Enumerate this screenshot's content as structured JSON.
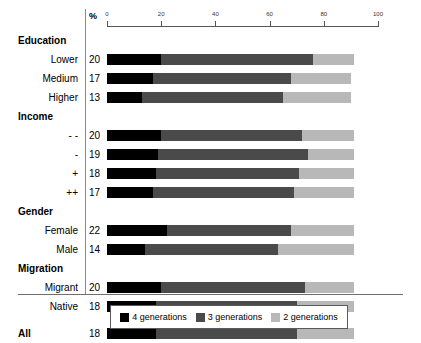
{
  "chart_data": {
    "type": "bar",
    "orientation": "horizontal",
    "stacked": true,
    "title": "",
    "xlabel": "%",
    "ylabel": "",
    "xlim": [
      0,
      100
    ],
    "xticks": [
      0,
      20,
      40,
      60,
      80,
      100
    ],
    "grid": false,
    "legend_position": "bottom",
    "series": [
      {
        "name": "4 generations",
        "color": "#000000",
        "values": [
          20,
          17,
          13,
          20,
          19,
          18,
          17,
          22,
          14,
          20,
          18,
          18
        ]
      },
      {
        "name": "3 generations",
        "color": "#4a4a4a",
        "values": [
          56,
          51,
          52,
          52,
          55,
          53,
          52,
          46,
          49,
          53,
          52,
          52
        ]
      },
      {
        "name": "2 generations",
        "color": "#b8b8b8",
        "values": [
          15,
          22,
          25,
          19,
          17,
          20,
          22,
          23,
          28,
          18,
          21,
          21
        ]
      }
    ],
    "categories": [
      "Lower",
      "Medium",
      "Higher",
      "- -",
      "-",
      "+",
      "++",
      "Female",
      "Male",
      "Migrant",
      "Native",
      "All"
    ],
    "group_headers": [
      "Education",
      "Income",
      "Gender",
      "Migration"
    ],
    "data_labels": [
      20,
      17,
      13,
      20,
      19,
      18,
      17,
      22,
      14,
      20,
      18,
      18
    ]
  },
  "axis": {
    "unit_label": "%",
    "ticks": [
      "0",
      "20",
      "40",
      "60",
      "80",
      "100"
    ]
  },
  "groups": [
    {
      "header": "Education",
      "rows": [
        {
          "label": "Lower",
          "value": "20",
          "segments": [
            20,
            56,
            15
          ]
        },
        {
          "label": "Medium",
          "value": "17",
          "segments": [
            17,
            51,
            22
          ]
        },
        {
          "label": "Higher",
          "value": "13",
          "segments": [
            13,
            52,
            25
          ]
        }
      ]
    },
    {
      "header": "Income",
      "rows": [
        {
          "label": "- -",
          "value": "20",
          "segments": [
            20,
            52,
            19
          ]
        },
        {
          "label": "-",
          "value": "19",
          "segments": [
            19,
            55,
            17
          ]
        },
        {
          "label": "+",
          "value": "18",
          "segments": [
            18,
            53,
            20
          ]
        },
        {
          "label": "++",
          "value": "17",
          "segments": [
            17,
            52,
            22
          ]
        }
      ]
    },
    {
      "header": "Gender",
      "rows": [
        {
          "label": "Female",
          "value": "22",
          "segments": [
            22,
            46,
            23
          ]
        },
        {
          "label": "Male",
          "value": "14",
          "segments": [
            14,
            49,
            28
          ]
        }
      ]
    },
    {
      "header": "Migration",
      "rows": [
        {
          "label": "Migrant",
          "value": "20",
          "segments": [
            20,
            53,
            18
          ]
        },
        {
          "label": "Native",
          "value": "18",
          "segments": [
            18,
            52,
            21
          ]
        }
      ]
    }
  ],
  "total_row": {
    "label": "All",
    "value": "18",
    "segments": [
      18,
      52,
      21
    ]
  },
  "legend": {
    "items": [
      {
        "label": "4 generations",
        "color": "#000000"
      },
      {
        "label": "3 generations",
        "color": "#4a4a4a"
      },
      {
        "label": "2 generations",
        "color": "#b8b8b8"
      }
    ]
  }
}
